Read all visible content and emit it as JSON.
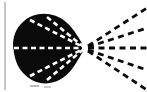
{
  "figure": {
    "caption": "",
    "width": 147,
    "height": 92,
    "background_color": "#ffffff"
  },
  "chart_data": {
    "type": "diagram",
    "xlabel": "",
    "ylabel": "",
    "xlim": [
      0,
      147
    ],
    "ylim": [
      0,
      92
    ],
    "grid": false,
    "legend": "none",
    "annotations": [],
    "focal_point": {
      "name": "convergence-point",
      "x": 85,
      "y": 48
    },
    "blob": {
      "name": "dark-lobed-body",
      "fill_color": "#0a0a0a",
      "outline_points": [
        [
          84,
          47
        ],
        [
          76,
          33
        ],
        [
          68,
          23
        ],
        [
          58,
          16
        ],
        [
          47,
          13.5
        ],
        [
          36,
          15
        ],
        [
          26,
          21
        ],
        [
          18,
          30
        ],
        [
          14.5,
          41
        ],
        [
          14.5,
          53
        ],
        [
          18,
          64
        ],
        [
          25,
          73
        ],
        [
          35,
          80
        ],
        [
          46,
          83
        ],
        [
          57,
          81
        ],
        [
          67,
          74
        ],
        [
          76,
          63
        ],
        [
          84,
          49
        ]
      ]
    },
    "left_axis_line": {
      "name": "left-vertical-rule",
      "x": 5,
      "y_start": 2,
      "y_end": 90,
      "color": "#8c8c8c",
      "width": 1
    },
    "interior_rays": {
      "dash_color": "#ffffff",
      "dash_pattern": [
        5,
        3.5
      ],
      "line_width": 2.6,
      "rays": [
        {
          "name": "interior-ray-upper-outer",
          "from": [
            30,
            20
          ],
          "to": [
            85,
            48
          ]
        },
        {
          "name": "interior-ray-upper-inner",
          "from": [
            47,
            17
          ],
          "to": [
            85,
            48
          ]
        },
        {
          "name": "interior-ray-horizontal",
          "from": [
            14,
            48
          ],
          "to": [
            85,
            48
          ]
        },
        {
          "name": "interior-ray-lower-inner",
          "from": [
            47,
            80
          ],
          "to": [
            85,
            48
          ]
        },
        {
          "name": "interior-ray-lower-outer",
          "from": [
            30,
            76
          ],
          "to": [
            85,
            48
          ]
        }
      ]
    },
    "exterior_rays": {
      "dash_color": "#0a0a0a",
      "dash_pattern": [
        6,
        4.5
      ],
      "line_width": 2.8,
      "rays": [
        {
          "name": "exterior-ray-upper-steep",
          "from": [
            88,
            46
          ],
          "to": [
            147,
            8
          ]
        },
        {
          "name": "exterior-ray-upper-shallow",
          "from": [
            88,
            47
          ],
          "to": [
            147,
            28
          ]
        },
        {
          "name": "exterior-ray-horizontal",
          "from": [
            88,
            48
          ],
          "to": [
            147,
            48
          ]
        },
        {
          "name": "exterior-ray-lower-shallow",
          "from": [
            88,
            50
          ],
          "to": [
            147,
            70
          ]
        },
        {
          "name": "exterior-ray-lower-steep",
          "from": [
            88,
            51
          ],
          "to": [
            147,
            90
          ]
        }
      ]
    },
    "speckles": [
      {
        "name": "speckle-bottom-left",
        "x": 30,
        "y": 85,
        "w": 9,
        "h": 2,
        "color": "#bdbdbd"
      },
      {
        "name": "speckle-bottom-mid",
        "x": 44,
        "y": 86,
        "w": 7,
        "h": 2,
        "color": "#cccccc"
      }
    ]
  }
}
